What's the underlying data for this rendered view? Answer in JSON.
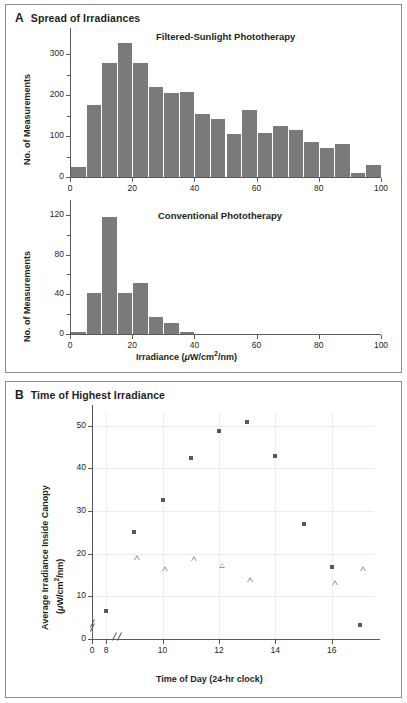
{
  "figure": {
    "panel_a": {
      "letter": "A",
      "title": "Spread of Irradiances",
      "axis_x_label": "Irradiance (μW/cm²/nm)",
      "axis_y_label": "No. of Measurements",
      "x_ticks": [
        "0",
        "20",
        "40",
        "60",
        "80",
        "100"
      ],
      "top_chart_title": "Filtered-Sunlight Phototherapy",
      "top_y_ticks": [
        "0",
        "100",
        "200",
        "300"
      ],
      "bottom_chart_title": "Conventional Phototherapy",
      "bottom_y_ticks": [
        "0",
        "40",
        "80",
        "120"
      ]
    },
    "panel_b": {
      "letter": "B",
      "title": "Time of Highest Irradiance",
      "axis_x_label": "Time of Day (24-hr clock)",
      "axis_y_label_line1": "Average Irradiance Inside Canopy",
      "axis_y_label_line2": "(μW/cm²/nm)",
      "x_ticks": [
        "0",
        "8",
        "10",
        "12",
        "14",
        "16"
      ],
      "y_ticks": [
        "0",
        "10",
        "20",
        "30",
        "40",
        "50"
      ]
    }
  },
  "chart_data": [
    {
      "type": "bar",
      "title": "Filtered-Sunlight Phototherapy",
      "xlabel": "Irradiance (μW/cm²/nm)",
      "ylabel": "No. of Measurements",
      "xlim": [
        0,
        100
      ],
      "ylim": [
        0,
        340
      ],
      "bin_width": 5,
      "grid": false,
      "categories": [
        "0-5",
        "5-10",
        "10-15",
        "15-20",
        "20-25",
        "25-30",
        "30-35",
        "35-40",
        "40-45",
        "45-50",
        "50-55",
        "55-60",
        "60-65",
        "65-70",
        "70-75",
        "75-80",
        "80-85",
        "85-90",
        "90-95",
        "95-100"
      ],
      "values": [
        25,
        175,
        278,
        327,
        279,
        219,
        206,
        208,
        153,
        141,
        105,
        164,
        107,
        124,
        116,
        86,
        72,
        80,
        10,
        29
      ]
    },
    {
      "type": "bar",
      "title": "Conventional Phototherapy",
      "xlabel": "Irradiance (μW/cm²/nm)",
      "ylabel": "No. of Measurements",
      "xlim": [
        0,
        100
      ],
      "ylim": [
        0,
        125
      ],
      "bin_width": 5,
      "grid": false,
      "categories": [
        "0-5",
        "5-10",
        "10-15",
        "15-20",
        "20-25",
        "25-30",
        "30-35",
        "35-40",
        "40-45",
        "45-50",
        "50-55",
        "55-60",
        "60-65",
        "65-70",
        "70-75",
        "75-80",
        "80-85",
        "85-90",
        "90-95",
        "95-100"
      ],
      "values": [
        2,
        41,
        118,
        41,
        51,
        17,
        11,
        2,
        0,
        0,
        0,
        0,
        0,
        0,
        0,
        0,
        0,
        0,
        0,
        0
      ]
    },
    {
      "type": "scatter",
      "title": "Time of Highest Irradiance",
      "xlabel": "Time of Day (24-hr clock)",
      "ylabel": "Average Irradiance Inside Canopy (μW/cm²/nm)",
      "xlim": [
        7.5,
        17.5
      ],
      "ylim": [
        0,
        53
      ],
      "grid": true,
      "x_axis_break": true,
      "y_axis_break": true,
      "series": [
        {
          "name": "filled-square",
          "marker": "square",
          "points": [
            {
              "x": 8,
              "y": 6.5
            },
            {
              "x": 9,
              "y": 25.0
            },
            {
              "x": 10,
              "y": 32.5
            },
            {
              "x": 11,
              "y": 42.5
            },
            {
              "x": 12,
              "y": 48.8
            },
            {
              "x": 13,
              "y": 51.0
            },
            {
              "x": 14,
              "y": 42.9
            },
            {
              "x": 15,
              "y": 26.9
            },
            {
              "x": 16,
              "y": 16.8
            },
            {
              "x": 17,
              "y": 3.2
            }
          ]
        },
        {
          "name": "open-triangle",
          "marker": "triangle",
          "points": [
            {
              "x": 9,
              "y": 19.0
            },
            {
              "x": 10,
              "y": 16.5
            },
            {
              "x": 11,
              "y": 18.8
            },
            {
              "x": 12,
              "y": 17.3
            },
            {
              "x": 13,
              "y": 13.9
            },
            {
              "x": 16,
              "y": 13.2
            },
            {
              "x": 17,
              "y": 16.4
            }
          ]
        }
      ]
    }
  ]
}
